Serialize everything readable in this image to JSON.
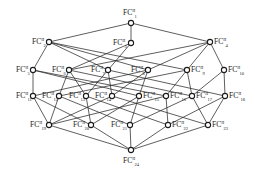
{
  "diagram": {
    "type": "concept-lattice",
    "label_prefix": "FC",
    "superscript": "II",
    "nodes": [
      {
        "id": 1,
        "label": "FC",
        "sub": "1",
        "x": 131,
        "y": 23,
        "lx": 123,
        "ly": 15,
        "pos": "top"
      },
      {
        "id": 2,
        "label": "FC",
        "sub": "2",
        "x": 49,
        "y": 42,
        "lx": 32,
        "ly": 44,
        "pos": "left"
      },
      {
        "id": 3,
        "label": "FC",
        "sub": "3",
        "x": 131,
        "y": 43,
        "lx": 113,
        "ly": 45,
        "pos": "left"
      },
      {
        "id": 4,
        "label": "FC",
        "sub": "4",
        "x": 210,
        "y": 42,
        "lx": 214,
        "ly": 44,
        "pos": "right"
      },
      {
        "id": 5,
        "label": "FC",
        "sub": "5",
        "x": 33,
        "y": 70,
        "lx": 16,
        "ly": 72,
        "pos": "left"
      },
      {
        "id": 6,
        "label": "FC",
        "sub": "6",
        "x": 69,
        "y": 70,
        "lx": 52,
        "ly": 72,
        "pos": "left"
      },
      {
        "id": 7,
        "label": "FC",
        "sub": "7",
        "x": 108,
        "y": 70,
        "lx": 91,
        "ly": 72,
        "pos": "left"
      },
      {
        "id": 8,
        "label": "FC",
        "sub": "8",
        "x": 148,
        "y": 70,
        "lx": 131,
        "ly": 72,
        "pos": "left"
      },
      {
        "id": 9,
        "label": "FC",
        "sub": "9",
        "x": 187,
        "y": 70,
        "lx": 191,
        "ly": 72,
        "pos": "right"
      },
      {
        "id": 10,
        "label": "FC",
        "sub": "10",
        "x": 224,
        "y": 70,
        "lx": 228,
        "ly": 72,
        "pos": "right"
      },
      {
        "id": 11,
        "label": "FC",
        "sub": "11",
        "x": 33,
        "y": 96,
        "lx": 16,
        "ly": 98,
        "pos": "left"
      },
      {
        "id": 12,
        "label": "FC",
        "sub": "12",
        "x": 59,
        "y": 96,
        "lx": 42,
        "ly": 98,
        "pos": "left"
      },
      {
        "id": 13,
        "label": "FC",
        "sub": "13",
        "x": 86,
        "y": 96,
        "lx": 69,
        "ly": 98,
        "pos": "left"
      },
      {
        "id": 14,
        "label": "FC",
        "sub": "14",
        "x": 112,
        "y": 96,
        "lx": 95,
        "ly": 98,
        "pos": "left"
      },
      {
        "id": 15,
        "label": "FC",
        "sub": "15",
        "x": 139,
        "y": 96,
        "lx": 143,
        "ly": 98,
        "pos": "right"
      },
      {
        "id": 16,
        "label": "FC",
        "sub": "16",
        "x": 166,
        "y": 96,
        "lx": 170,
        "ly": 98,
        "pos": "right"
      },
      {
        "id": 17,
        "label": "FC",
        "sub": "17",
        "x": 192,
        "y": 96,
        "lx": 196,
        "ly": 98,
        "pos": "right"
      },
      {
        "id": 18,
        "label": "FC",
        "sub": "18",
        "x": 225,
        "y": 96,
        "lx": 229,
        "ly": 98,
        "pos": "right"
      },
      {
        "id": 19,
        "label": "FC",
        "sub": "19",
        "x": 49,
        "y": 125,
        "lx": 30,
        "ly": 127,
        "pos": "left"
      },
      {
        "id": 20,
        "label": "FC",
        "sub": "20",
        "x": 91,
        "y": 125,
        "lx": 73,
        "ly": 127,
        "pos": "left"
      },
      {
        "id": 21,
        "label": "FC",
        "sub": "21",
        "x": 130,
        "y": 125,
        "lx": 111,
        "ly": 127,
        "pos": "left"
      },
      {
        "id": 22,
        "label": "FC",
        "sub": "22",
        "x": 168,
        "y": 125,
        "lx": 172,
        "ly": 127,
        "pos": "right"
      },
      {
        "id": 23,
        "label": "FC",
        "sub": "23",
        "x": 208,
        "y": 125,
        "lx": 212,
        "ly": 127,
        "pos": "right"
      },
      {
        "id": 24,
        "label": "FC",
        "sub": "24",
        "x": 131,
        "y": 150,
        "lx": 123,
        "ly": 163,
        "pos": "bottom"
      }
    ],
    "edges": [
      [
        1,
        2
      ],
      [
        1,
        3
      ],
      [
        1,
        4
      ],
      [
        2,
        5
      ],
      [
        2,
        7
      ],
      [
        2,
        8
      ],
      [
        2,
        9
      ],
      [
        3,
        6
      ],
      [
        3,
        7
      ],
      [
        4,
        6
      ],
      [
        4,
        8
      ],
      [
        4,
        9
      ],
      [
        4,
        10
      ],
      [
        5,
        11
      ],
      [
        5,
        15
      ],
      [
        5,
        16
      ],
      [
        6,
        12
      ],
      [
        6,
        13
      ],
      [
        6,
        17
      ],
      [
        7,
        13
      ],
      [
        7,
        14
      ],
      [
        7,
        18
      ],
      [
        8,
        14
      ],
      [
        8,
        15
      ],
      [
        8,
        11
      ],
      [
        9,
        16
      ],
      [
        9,
        17
      ],
      [
        9,
        12
      ],
      [
        10,
        17
      ],
      [
        10,
        18
      ],
      [
        11,
        19
      ],
      [
        11,
        20
      ],
      [
        12,
        19
      ],
      [
        12,
        21
      ],
      [
        13,
        20
      ],
      [
        13,
        22
      ],
      [
        14,
        19
      ],
      [
        14,
        23
      ],
      [
        15,
        20
      ],
      [
        15,
        21
      ],
      [
        16,
        22
      ],
      [
        16,
        19
      ],
      [
        17,
        23
      ],
      [
        17,
        21
      ],
      [
        18,
        22
      ],
      [
        18,
        23
      ],
      [
        19,
        24
      ],
      [
        20,
        24
      ],
      [
        21,
        24
      ],
      [
        22,
        24
      ],
      [
        23,
        24
      ]
    ]
  }
}
